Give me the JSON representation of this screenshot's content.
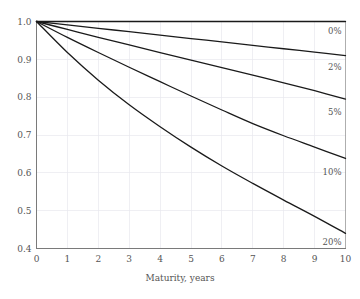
{
  "chart_data": {
    "type": "line",
    "title": "",
    "subtitle": "",
    "xlabel": "Maturity, years",
    "ylabel": "",
    "xlim": [
      0,
      10
    ],
    "ylim": [
      0.4,
      1.0
    ],
    "xticks": [
      "0",
      "1",
      "2",
      "3",
      "4",
      "5",
      "6",
      "7",
      "8",
      "9",
      "10"
    ],
    "yticks": [
      "0.4",
      "0.5",
      "0.6",
      "0.7",
      "0.8",
      "0.9",
      "1.0"
    ],
    "grid": true,
    "legend_position": "inline-right",
    "x": [
      0,
      1,
      2,
      3,
      4,
      5,
      6,
      7,
      8,
      9,
      10
    ],
    "series": [
      {
        "name": "0%",
        "label": "0%",
        "color": "#1a1a1a",
        "values": [
          1.0,
          1.0,
          1.0,
          1.0,
          1.0,
          1.0,
          1.0,
          1.0,
          1.0,
          1.0,
          1.0
        ],
        "label_x": 10,
        "label_y": 0.975
      },
      {
        "name": "2%",
        "label": "2%",
        "color": "#1a1a1a",
        "values": [
          1.0,
          0.991,
          0.982,
          0.973,
          0.964,
          0.955,
          0.946,
          0.937,
          0.928,
          0.919,
          0.91
        ],
        "label_x": 10,
        "label_y": 0.88
      },
      {
        "name": "5%",
        "label": "5%",
        "color": "#1a1a1a",
        "values": [
          1.0,
          0.979,
          0.958,
          0.938,
          0.918,
          0.898,
          0.878,
          0.858,
          0.838,
          0.817,
          0.795
        ],
        "label_x": 10,
        "label_y": 0.762
      },
      {
        "name": "10%",
        "label": "10%",
        "color": "#1a1a1a",
        "values": [
          1.0,
          0.958,
          0.918,
          0.879,
          0.841,
          0.803,
          0.766,
          0.73,
          0.698,
          0.668,
          0.638
        ],
        "label_x": 10,
        "label_y": 0.602
      },
      {
        "name": "20%",
        "label": "20%",
        "color": "#1a1a1a",
        "values": [
          1.0,
          0.918,
          0.845,
          0.78,
          0.722,
          0.668,
          0.618,
          0.572,
          0.528,
          0.485,
          0.44
        ],
        "label_x": 10,
        "label_y": 0.418
      }
    ]
  },
  "axes": {
    "x_axis_name": "maturity-axis",
    "y_axis_name": "discount-factor-axis"
  }
}
